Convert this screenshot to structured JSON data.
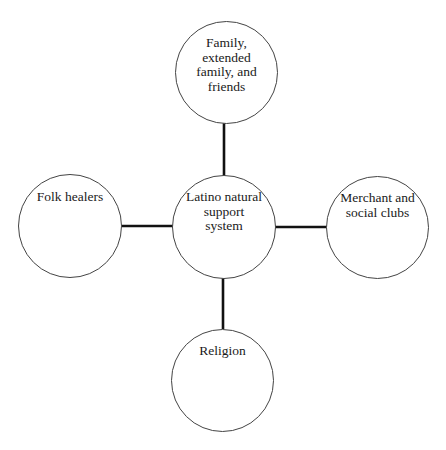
{
  "diagram": {
    "type": "hub-and-spoke",
    "center": {
      "id": "center",
      "label": "Latino natural support system"
    },
    "nodes": [
      {
        "id": "top",
        "label": "Family, extended family, and friends",
        "lines": [
          "Family,",
          "extended",
          "family, and",
          "friends"
        ]
      },
      {
        "id": "left",
        "label": "Folk healers",
        "lines": [
          "Folk healers"
        ]
      },
      {
        "id": "right",
        "label": "Merchant and social clubs",
        "lines": [
          "Merchant and",
          "social clubs"
        ]
      },
      {
        "id": "bottom",
        "label": "Religion",
        "lines": [
          "Religion"
        ]
      }
    ],
    "center_lines": [
      "Latino natural",
      "support",
      "system"
    ],
    "edges": [
      {
        "from": "center",
        "to": "top"
      },
      {
        "from": "center",
        "to": "left"
      },
      {
        "from": "center",
        "to": "right"
      },
      {
        "from": "center",
        "to": "bottom"
      }
    ],
    "colors": {
      "stroke": "#444444",
      "connector": "#111111",
      "text": "#1a1a1a",
      "background": "#ffffff"
    }
  }
}
